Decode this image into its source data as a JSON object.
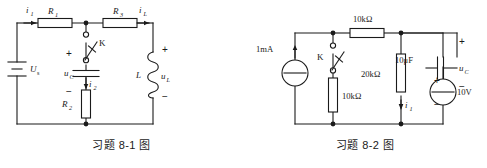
{
  "page": {
    "width": 487,
    "height": 168,
    "background": "#ffffff",
    "ink": "#1a1a1a"
  },
  "figures": [
    {
      "id": "fig-8-1",
      "caption": "习题 8-1 图",
      "description": "RLC switching circuit with DC voltage source",
      "elements": {
        "source_label": "U",
        "source_sub": "s",
        "current_in": "i",
        "current_in_sub": "1",
        "r1": "R",
        "r1_sub": "1",
        "r3": "R",
        "r3_sub": "3",
        "r2": "R",
        "r2_sub": "2",
        "switch": "K",
        "cap_label": "u",
        "cap_sub": "C",
        "branch_current": "i",
        "branch_current_sub": "2",
        "inductor": "L",
        "inductor_volt": "u",
        "inductor_volt_sub": "L",
        "inductor_current": "i",
        "inductor_current_sub": "L",
        "plus": "+",
        "minus": "−"
      }
    },
    {
      "id": "fig-8-2",
      "caption": "习题 8-2 图",
      "description": "Switched resistive network with current source, capacitor and voltage source",
      "elements": {
        "current_source": "1mA",
        "switch": "K",
        "r_switch_branch": "10kΩ",
        "r_top": "10kΩ",
        "r_middle": "20kΩ",
        "capacitor": "10μF",
        "cap_label": "u",
        "cap_sub": "C",
        "voltage_source": "10V",
        "branch_current": "i",
        "branch_current_sub": "1",
        "plus": "+",
        "minus": "−"
      }
    }
  ]
}
